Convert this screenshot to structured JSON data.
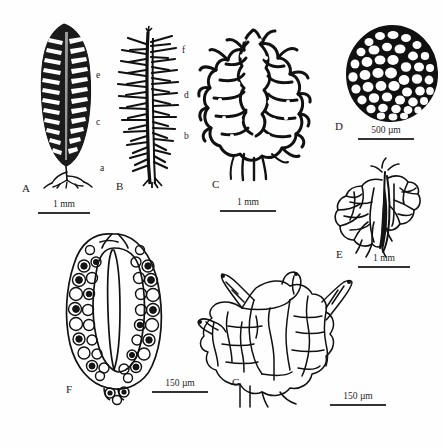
{
  "figure": {
    "type": "scientific-illustration-plate",
    "background_color": "#ffffff",
    "ink_color": "#111111",
    "width": 445,
    "height": 448
  },
  "panels": [
    {
      "id": "A",
      "label": "A",
      "subject": "whole-plant-habit",
      "scalebar": {
        "text": "1 mm",
        "length_px": 52
      }
    },
    {
      "id": "B",
      "label": "B",
      "subject": "branch-with-leaves",
      "sub_labels": [
        {
          "text": "a",
          "side": "left"
        },
        {
          "text": "b",
          "side": "right"
        },
        {
          "text": "c",
          "side": "left"
        },
        {
          "text": "d",
          "side": "right"
        },
        {
          "text": "e",
          "side": "left"
        },
        {
          "text": "f",
          "side": "right"
        }
      ],
      "scalebar": {
        "text": "1 mm",
        "length_px": 56
      }
    },
    {
      "id": "C",
      "label": "C",
      "subject": "leaf-areolation-network",
      "scalebar": {
        "text": "1 mm",
        "length_px": 56
      }
    },
    {
      "id": "D",
      "label": "D",
      "subject": "spore-surface-cells",
      "scalebar": {
        "text": "500 µm",
        "length_px": 56
      }
    },
    {
      "id": "E",
      "label": "E",
      "subject": "branched-leaf-segment",
      "scalebar": {
        "text": "1 mm",
        "length_px": 52
      }
    },
    {
      "id": "F",
      "label": "F",
      "subject": "capsule-longitudinal-section",
      "scalebar": {
        "text": "150 µm",
        "length_px": 56
      }
    },
    {
      "id": "G",
      "label": "G",
      "subject": "leaf-cells-detail",
      "scalebar": {
        "text": "150 µm",
        "length_px": 56
      }
    }
  ]
}
